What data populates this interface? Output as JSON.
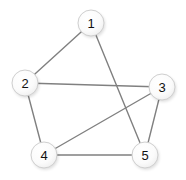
{
  "figure": {
    "background_color": "#ffffff",
    "width": 186,
    "height": 180
  },
  "style": {
    "node_fill": "#ffffff",
    "node_fill_highlight": "#fdfdfd",
    "node_stroke": "#cfcfcf",
    "node_radius": 13,
    "node_label_color": "#111111",
    "edge_color": "#808080",
    "edge_width": 1.4,
    "shadow_color": "#000000"
  },
  "chart_data": {
    "type": "graph",
    "title": "",
    "directed": false,
    "weighted": false,
    "node_count": 5,
    "edge_count": 7,
    "nodes": [
      {
        "id": "1",
        "label": "1",
        "x": 91,
        "y": 23
      },
      {
        "id": "2",
        "label": "2",
        "x": 25,
        "y": 83
      },
      {
        "id": "3",
        "label": "3",
        "x": 162,
        "y": 87
      },
      {
        "id": "4",
        "label": "4",
        "x": 44,
        "y": 155
      },
      {
        "id": "5",
        "label": "5",
        "x": 145,
        "y": 155
      }
    ],
    "edges": [
      {
        "source": "1",
        "target": "2",
        "x1": 91,
        "y1": 23,
        "x2": 25,
        "y2": 83
      },
      {
        "source": "1",
        "target": "5",
        "x1": 91,
        "y1": 23,
        "x2": 145,
        "y2": 155
      },
      {
        "source": "2",
        "target": "3",
        "x1": 25,
        "y1": 83,
        "x2": 162,
        "y2": 87
      },
      {
        "source": "2",
        "target": "4",
        "x1": 25,
        "y1": 83,
        "x2": 44,
        "y2": 155
      },
      {
        "source": "3",
        "target": "4",
        "x1": 162,
        "y1": 87,
        "x2": 44,
        "y2": 155
      },
      {
        "source": "3",
        "target": "5",
        "x1": 162,
        "y1": 87,
        "x2": 145,
        "y2": 155
      },
      {
        "source": "4",
        "target": "5",
        "x1": 44,
        "y1": 155,
        "x2": 145,
        "y2": 155
      }
    ],
    "adjacency": {
      "1": [
        "2",
        "5"
      ],
      "2": [
        "1",
        "3",
        "4"
      ],
      "3": [
        "2",
        "4",
        "5"
      ],
      "4": [
        "2",
        "3",
        "5"
      ],
      "5": [
        "1",
        "3",
        "4"
      ]
    }
  }
}
